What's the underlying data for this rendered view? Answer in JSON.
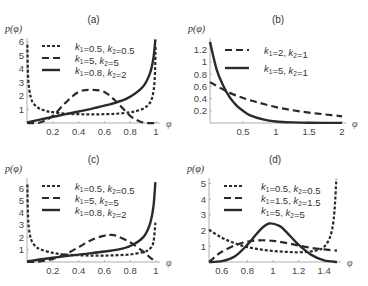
{
  "chart_data": [
    {
      "id": "a",
      "type": "line",
      "title": "(a)",
      "xlabel": "φ",
      "ylabel": "p(φ)",
      "xlim": [
        0,
        1
      ],
      "ylim": [
        0,
        6.3
      ],
      "xticks": [
        0.2,
        0.4,
        0.6,
        0.8,
        1
      ],
      "xtick_labels": [
        "0.2",
        "0.4",
        "0.6",
        "0.8",
        "1"
      ],
      "yticks": [
        1,
        2,
        3,
        4,
        5,
        6
      ],
      "ytick_labels": [
        "1",
        "2",
        "3",
        "4",
        "5",
        "6"
      ],
      "frame": {
        "x0": 27,
        "x1": 156,
        "y0": 123,
        "ytop": 40,
        "yunit": 13.5
      },
      "legend": [
        {
          "style": "dotted",
          "k1": "0.5",
          "k2": "0.5"
        },
        {
          "style": "dashed",
          "k1": "5",
          "k2": "5"
        },
        {
          "style": "solid",
          "k1": "0.8",
          "k2": "2"
        }
      ],
      "series": [
        {
          "name": "k1=0.5, k2=0.5",
          "style": "dotted",
          "x": [
            0.003,
            0.01,
            0.03,
            0.06,
            0.1,
            0.15,
            0.2,
            0.3,
            0.4,
            0.5,
            0.6,
            0.7,
            0.8,
            0.85,
            0.9,
            0.94,
            0.97,
            0.99,
            0.997
          ],
          "y": [
            5.8,
            3.2,
            1.87,
            1.34,
            1.06,
            0.89,
            0.8,
            0.69,
            0.65,
            0.64,
            0.65,
            0.69,
            0.8,
            0.89,
            1.06,
            1.34,
            1.87,
            3.2,
            5.8
          ]
        },
        {
          "name": "k1=5, k2=5",
          "style": "dashed",
          "x": [
            0,
            0.1,
            0.2,
            0.3,
            0.4,
            0.5,
            0.6,
            0.7,
            0.8,
            0.9,
            1
          ],
          "y": [
            0,
            0.04,
            0.53,
            1.51,
            2.3,
            2.46,
            2.3,
            1.51,
            0.53,
            0.04,
            0
          ]
        },
        {
          "name": "k1=0.8, k2=2",
          "style": "solid",
          "x": [
            0,
            0.1,
            0.2,
            0.3,
            0.4,
            0.5,
            0.6,
            0.7,
            0.8,
            0.9,
            0.95,
            0.98,
            0.995
          ],
          "y": [
            0.05,
            0.25,
            0.45,
            0.65,
            0.85,
            1.05,
            1.28,
            1.55,
            1.95,
            2.7,
            3.6,
            4.8,
            6.2
          ]
        }
      ]
    },
    {
      "id": "b",
      "type": "line",
      "title": "(b)",
      "xlabel": "φ",
      "ylabel": "p(φ)",
      "xlim": [
        0,
        2
      ],
      "ylim": [
        0,
        1.35
      ],
      "xticks": [
        0.5,
        1,
        1.5,
        2
      ],
      "xtick_labels": [
        "0.5",
        "1",
        "1.5",
        "2"
      ],
      "yticks": [
        0.2,
        0.4,
        0.6,
        0.8,
        1,
        1.2
      ],
      "ytick_labels": [
        "0.2",
        "0.4",
        "0.6",
        "0.8",
        "1",
        "1.2"
      ],
      "frame": {
        "x0": 210,
        "x1": 342,
        "y0": 123,
        "ytop": 40,
        "yunit": 61
      },
      "legend": [
        {
          "style": "dashed",
          "k1": "2",
          "k2": "1"
        },
        {
          "style": "solid",
          "k1": "5",
          "k2": "1"
        }
      ],
      "series": [
        {
          "name": "k1=2, k2=1",
          "style": "dashed",
          "x": [
            0,
            0.25,
            0.5,
            0.75,
            1,
            1.25,
            1.5,
            1.75,
            2
          ],
          "y": [
            0.67,
            0.52,
            0.41,
            0.33,
            0.26,
            0.21,
            0.17,
            0.14,
            0.11
          ]
        },
        {
          "name": "k1=5, k2=1",
          "style": "solid",
          "x": [
            0,
            0.1,
            0.2,
            0.3,
            0.4,
            0.5,
            0.6,
            0.8,
            1,
            1.25,
            1.5,
            2
          ],
          "y": [
            1.33,
            0.88,
            0.61,
            0.42,
            0.29,
            0.2,
            0.13,
            0.06,
            0.025,
            0.01,
            0.004,
            0.001
          ]
        }
      ]
    },
    {
      "id": "c",
      "type": "line",
      "title": "(c)",
      "xlabel": "φ",
      "ylabel": "p(φ)",
      "xlim": [
        0,
        1
      ],
      "ylim": [
        0,
        6.5
      ],
      "xticks": [
        0.2,
        0.4,
        0.6,
        0.8,
        1
      ],
      "xtick_labels": [
        "0.2",
        "0.4",
        "0.6",
        "0.8",
        "1"
      ],
      "yticks": [
        1,
        2,
        3,
        4,
        5,
        6
      ],
      "ytick_labels": [
        "1",
        "2",
        "3",
        "4",
        "5",
        "6"
      ],
      "frame": {
        "x0": 27,
        "x1": 156,
        "y0": 262,
        "ytop": 180,
        "yunit": 12.3
      },
      "legend": [
        {
          "style": "dotted",
          "k1": "0.5",
          "k2": "0.5"
        },
        {
          "style": "dashed",
          "k1": "5",
          "k2": "5"
        },
        {
          "style": "solid",
          "k1": "0.8",
          "k2": "2"
        }
      ],
      "series": [
        {
          "name": "k1=0.5, k2=0.5",
          "style": "dotted",
          "x": [
            0.003,
            0.01,
            0.03,
            0.06,
            0.1,
            0.2,
            0.3,
            0.4,
            0.5,
            0.6,
            0.7,
            0.8,
            0.9,
            0.95,
            0.98,
            0.995
          ],
          "y": [
            6.3,
            3.3,
            1.9,
            1.35,
            1.05,
            0.75,
            0.6,
            0.55,
            0.52,
            0.52,
            0.55,
            0.62,
            0.8,
            1.05,
            1.6,
            3.2
          ]
        },
        {
          "name": "k1=5, k2=5",
          "style": "dashed",
          "x": [
            0,
            0.1,
            0.2,
            0.3,
            0.4,
            0.5,
            0.6,
            0.65,
            0.7,
            0.8,
            0.9,
            0.95,
            1
          ],
          "y": [
            0,
            0.05,
            0.25,
            0.65,
            1.2,
            1.8,
            2.15,
            2.2,
            2.1,
            1.6,
            0.85,
            0.4,
            0
          ]
        },
        {
          "name": "k1=0.8, k2=2",
          "style": "solid",
          "x": [
            0,
            0.1,
            0.2,
            0.3,
            0.4,
            0.5,
            0.6,
            0.7,
            0.8,
            0.9,
            0.95,
            0.98,
            0.995
          ],
          "y": [
            0.05,
            0.2,
            0.35,
            0.48,
            0.6,
            0.72,
            0.85,
            1.0,
            1.3,
            2.0,
            3.0,
            4.5,
            6.5
          ]
        }
      ]
    },
    {
      "id": "d",
      "type": "line",
      "title": "(d)",
      "xlabel": "φ",
      "ylabel": "p(φ)",
      "xlim": [
        0.5,
        1.5
      ],
      "ylim": [
        0,
        5.3
      ],
      "xticks": [
        0.6,
        0.8,
        1,
        1.2,
        1.4
      ],
      "xtick_labels": [
        "0.6",
        "0.8",
        "1",
        "1.2",
        "1.4"
      ],
      "yticks": [
        1,
        2,
        3,
        4,
        5
      ],
      "ytick_labels": [
        "1",
        "2",
        "3",
        "4",
        "5"
      ],
      "frame": {
        "x0": 209,
        "x1": 337,
        "y0": 262,
        "ytop": 180,
        "yunit": 15.7
      },
      "legend": [
        {
          "style": "dotted",
          "k1": "0.5",
          "k2": "0.5"
        },
        {
          "style": "dashed",
          "k1": "1.5",
          "k2": "1.5"
        },
        {
          "style": "solid",
          "k1": "5",
          "k2": "5"
        }
      ],
      "series": [
        {
          "name": "k1=0.5, k2=0.5",
          "style": "dotted",
          "x": [
            0.5,
            0.6,
            0.7,
            0.8,
            0.9,
            1.0,
            1.1,
            1.2,
            1.3,
            1.38,
            1.43,
            1.46,
            1.48,
            1.495
          ],
          "y": [
            2.05,
            1.55,
            1.2,
            0.95,
            0.8,
            0.7,
            0.65,
            0.62,
            0.68,
            0.85,
            1.3,
            2.0,
            3.2,
            5.3
          ]
        },
        {
          "name": "k1=1.5, k2=1.5",
          "style": "dashed",
          "x": [
            0.5,
            0.55,
            0.6,
            0.7,
            0.8,
            0.9,
            1.0,
            1.1,
            1.2,
            1.3,
            1.4,
            1.5
          ],
          "y": [
            0,
            0.35,
            0.65,
            1.05,
            1.3,
            1.38,
            1.35,
            1.22,
            1.05,
            0.9,
            0.8,
            0.72
          ]
        },
        {
          "name": "k1=5, k2=5",
          "style": "solid",
          "x": [
            0.5,
            0.6,
            0.7,
            0.8,
            0.9,
            0.97,
            1.05,
            1.1,
            1.2,
            1.3,
            1.4,
            1.5
          ],
          "y": [
            0,
            0.05,
            0.35,
            1.1,
            2.05,
            2.45,
            2.3,
            1.95,
            1.1,
            0.45,
            0.1,
            0
          ]
        }
      ]
    }
  ],
  "legend_label": {
    "k1": "k",
    "k2": "k",
    "sub1": "1",
    "sub2": "2"
  }
}
